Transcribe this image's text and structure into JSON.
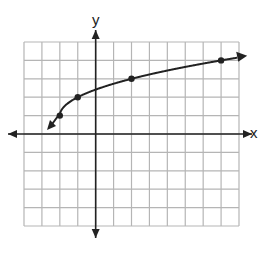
{
  "chart_data": {
    "type": "line",
    "title": "",
    "xlabel": "x",
    "ylabel": "y",
    "xlim": [
      -4,
      8
    ],
    "ylim": [
      -5,
      5
    ],
    "grid": true,
    "tick_labels": false,
    "series": [
      {
        "name": "y = √(x+2) + 1",
        "function": "sqrt(x+2)+1",
        "marked_points": [
          [
            -2,
            1
          ],
          [
            -1,
            2
          ],
          [
            2,
            3
          ],
          [
            7,
            4
          ]
        ],
        "arrows": "both ends",
        "color": "#222222"
      }
    ]
  },
  "axes": {
    "x_label": "x",
    "y_label": "y"
  }
}
